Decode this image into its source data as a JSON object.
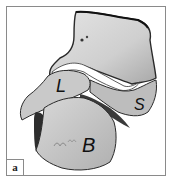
{
  "figure": {
    "panel_label": "a",
    "labels": {
      "L": "L",
      "S": "S",
      "B": "B"
    },
    "colors": {
      "bone_light": "#d2d2d2",
      "bone_mid": "#b4b4b4",
      "bone_dark": "#3a3a3a",
      "border": "#8a8a8a"
    }
  }
}
